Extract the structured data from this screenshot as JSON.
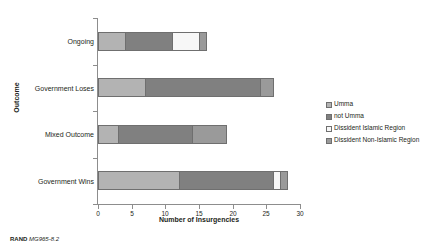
{
  "credit": {
    "org": "RAND",
    "figure_id": "MG965-8.2"
  },
  "chart_data": {
    "type": "bar",
    "orientation": "horizontal",
    "stacked": true,
    "title": "",
    "xlabel": "Number of Insurgencies",
    "ylabel": "Outcome",
    "xlim": [
      0,
      30
    ],
    "xticks": [
      0,
      5,
      10,
      15,
      20,
      25,
      30
    ],
    "grid": false,
    "legend_position": "right",
    "categories": [
      "Government Wins",
      "Mixed Outcome",
      "Government Loses",
      "Ongoing"
    ],
    "categories_top_to_bottom": [
      "Ongoing",
      "Government Loses",
      "Mixed Outcome",
      "Government Wins"
    ],
    "series": [
      {
        "name": "Umma",
        "color": "#b3b3b3",
        "values": [
          12,
          3,
          7,
          4
        ]
      },
      {
        "name": "not Umma",
        "color": "#808080",
        "values": [
          14,
          11,
          17,
          7
        ]
      },
      {
        "name": "Dissident Islamic Region",
        "color": "#f7f7f7",
        "values": [
          1,
          0,
          0,
          4
        ]
      },
      {
        "name": "Dissident Non-Islamic Region",
        "color": "#9a9a9a",
        "values": [
          1,
          5,
          2,
          1
        ]
      }
    ],
    "totals": [
      28,
      19,
      26,
      16
    ]
  },
  "axis": {
    "xtick_labels": [
      "0",
      "5",
      "10",
      "15",
      "20",
      "25",
      "30"
    ],
    "category_labels": {
      "ongoing": "Ongoing",
      "government_loses": "Government Loses",
      "mixed_outcome": "Mixed Outcome",
      "government_wins": "Government Wins"
    }
  },
  "legend": {
    "items": [
      {
        "label": "Umma",
        "color": "#b3b3b3"
      },
      {
        "label": "not Umma",
        "color": "#808080"
      },
      {
        "label": "Dissident Islamic Region",
        "color": "#f7f7f7"
      },
      {
        "label": "Dissident Non-Islamic Region",
        "color": "#9a9a9a"
      }
    ]
  },
  "colors": {
    "axis": "#8d8d8d",
    "bar_outline": "#6f6f6f",
    "text": "#231f20",
    "background": "#ffffff"
  }
}
